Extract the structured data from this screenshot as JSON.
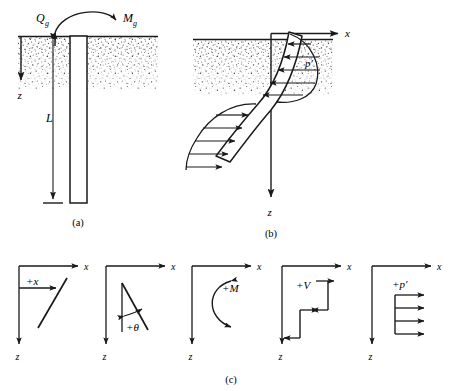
{
  "figure": {
    "type": "engineering-diagram",
    "panels": [
      {
        "id": "a",
        "caption": "(a)",
        "description": "Pile embedded in soil with lateral load and moment applied at ground level",
        "labels": {
          "lateral_load": "Q",
          "lateral_load_sub": "g",
          "moment": "M",
          "moment_sub": "g",
          "depth_axis": "z",
          "length": "L"
        }
      },
      {
        "id": "b",
        "caption": "(b)",
        "description": "Deflected shape of pile with soil reaction pressure distribution",
        "labels": {
          "horizontal_axis": "x",
          "depth_axis": "z",
          "soil_reaction": "p′"
        }
      },
      {
        "id": "c",
        "caption": "(c)",
        "description": "Sign conventions for deflection, slope, moment, shear and soil reaction",
        "conventions": [
          {
            "symbol": "+x",
            "name": "deflection"
          },
          {
            "symbol": "+θ",
            "name": "slope"
          },
          {
            "symbol": "+M",
            "name": "bending-moment"
          },
          {
            "symbol": "+V",
            "name": "shear-force"
          },
          {
            "symbol": "+p′",
            "name": "soil-reaction"
          }
        ],
        "axis_labels": {
          "horizontal": "x",
          "vertical": "z"
        }
      }
    ],
    "colors": {
      "ink": "#1a1a1a",
      "soil_stipple": "#555555",
      "background": "#ffffff"
    }
  }
}
